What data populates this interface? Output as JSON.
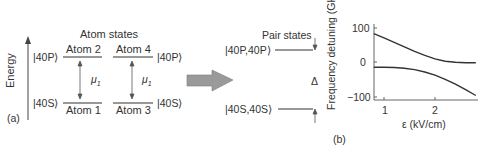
{
  "panel_a": {
    "label": "(a)",
    "axis_label": "Energy",
    "title": "Atom states",
    "ket_40P_left": "|40P⟩",
    "ket_40S_left": "|40S⟩",
    "ket_40P_right": "|40P⟩",
    "ket_40S_right": "|40S⟩",
    "atom2": "Atom 2",
    "atom4": "Atom 4",
    "atom1": "Atom 1",
    "atom3": "Atom 3",
    "mu_left": "μ",
    "mu_left_sub": "1",
    "mu_right": "μ",
    "mu_right_sub": "1"
  },
  "pair": {
    "title": "Pair states",
    "ket_PP": "|40P,40P⟩",
    "ket_SS": "|40S,40S⟩",
    "delta": "Δ"
  },
  "panel_b": {
    "label": "(b)",
    "ylabel": "Frequency detuning (GHz)",
    "xlabel": "ε (kV/cm)",
    "yticks": [
      "100",
      "0",
      "−100"
    ],
    "xticks": [
      "1",
      "2"
    ]
  },
  "chart_data": {
    "type": "line",
    "title": "",
    "xlabel": "ε (kV/cm)",
    "ylabel": "Frequency detuning (GHz)",
    "xlim": [
      0.8,
      2.85
    ],
    "ylim": [
      -110,
      115
    ],
    "xticks": [
      1,
      2
    ],
    "yticks": [
      100,
      0,
      -100
    ],
    "grid": false,
    "legend": null,
    "x": [
      0.8,
      1.0,
      1.2,
      1.4,
      1.6,
      1.8,
      2.0,
      2.2,
      2.4,
      2.6,
      2.8
    ],
    "series": [
      {
        "name": "upper branch (|40P,40P⟩)",
        "values": [
          82,
          70,
          57,
          44,
          31,
          19,
          9,
          2,
          -1,
          -2,
          -2
        ]
      },
      {
        "name": "lower branch (|40S,40S⟩)",
        "values": [
          -15,
          -15,
          -16,
          -18,
          -22,
          -29,
          -38,
          -50,
          -64,
          -80,
          -97
        ]
      }
    ]
  }
}
